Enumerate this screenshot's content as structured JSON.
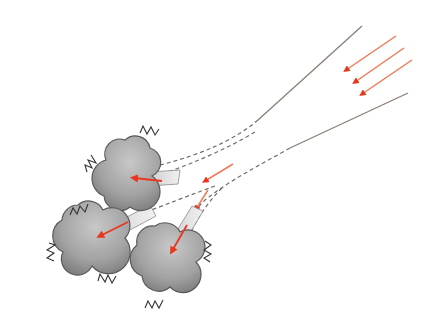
{
  "diagram": {
    "title": "",
    "colors": {
      "background": "#ffffff",
      "beam_line": "#8a7f78",
      "arrow": "#e8361f",
      "arrow_light": "#f07a55",
      "particle_fill_light": "#c4c4c4",
      "particle_fill_dark": "#7e7e7e",
      "particle_stroke": "#5a5a5a",
      "channel_fill": "#d9d9d9",
      "vibration": "#333333"
    },
    "incoming_arrows": 4,
    "particles": [
      {
        "id": "particle-top",
        "label": ""
      },
      {
        "id": "particle-left",
        "label": ""
      },
      {
        "id": "particle-bottom",
        "label": ""
      }
    ],
    "vibration_marks": 8
  }
}
